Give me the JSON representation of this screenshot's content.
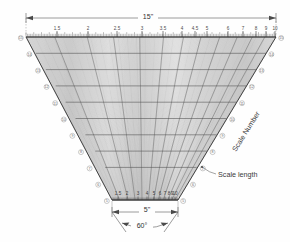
{
  "figure": {
    "background_color": "#fefefe",
    "ink_color": "#3a3a3a"
  },
  "top_dimension": {
    "name": "overall-width",
    "value": "15\"",
    "arrow_left": "◀",
    "arrow_right": "▶"
  },
  "bottom_dimension": {
    "name": "base-width",
    "value": "5\""
  },
  "angle_dimension": {
    "name": "included-angle",
    "value": "60°"
  },
  "top_scale": {
    "label": "top-scale",
    "ticks": [
      "1.5",
      "2",
      "2.5",
      "3",
      "3.5",
      "4",
      "4.5",
      "5",
      "6",
      "7",
      "8",
      "9",
      "10"
    ],
    "positions": [
      57,
      88,
      117,
      142,
      163,
      182,
      195,
      207,
      228,
      243,
      256,
      266,
      275
    ]
  },
  "bottom_scale": {
    "label": "bottom-scale",
    "ticks": [
      "1.5",
      "2",
      "3",
      "4",
      "5",
      "6",
      "7",
      "8",
      "9",
      "10"
    ],
    "positions": [
      118,
      127,
      138,
      147,
      154,
      160,
      165,
      169,
      172,
      175
    ]
  },
  "left_markers": {
    "label": "left-edge-markers",
    "values": [
      "15",
      "14",
      "13",
      "12",
      "11",
      "10",
      "9",
      "8",
      "7",
      "6",
      "5"
    ]
  },
  "right_markers": {
    "label": "right-edge-markers",
    "values": [
      "15",
      "14",
      "13",
      "12",
      "11",
      "10",
      "9",
      "8",
      "7",
      "6",
      "5"
    ]
  },
  "annotations": {
    "scale_length": "Scale length",
    "scale_number": "Scale Number"
  },
  "chart_data": {
    "type": "line",
    "xlabel": "Scale Number",
    "ylabel": "Scale length",
    "grid": true,
    "legend": "none",
    "top_axis_range": [
      1.5,
      10
    ],
    "bottom_axis_range": [
      1.5,
      10
    ],
    "top_axis_ticks": [
      "1.5",
      "2",
      "2.5",
      "3",
      "3.5",
      "4",
      "4.5",
      "5",
      "6",
      "7",
      "8",
      "9",
      "10"
    ],
    "bottom_axis_ticks": [
      "1.5",
      "2",
      "3",
      "4",
      "5",
      "6",
      "7",
      "8",
      "9",
      "10"
    ],
    "row_levels": [
      "15",
      "14",
      "13",
      "12",
      "11",
      "10",
      "9",
      "8",
      "7",
      "6",
      "5"
    ],
    "overall_width_in": 15,
    "base_width_in": 5,
    "included_angle_deg": 60
  }
}
